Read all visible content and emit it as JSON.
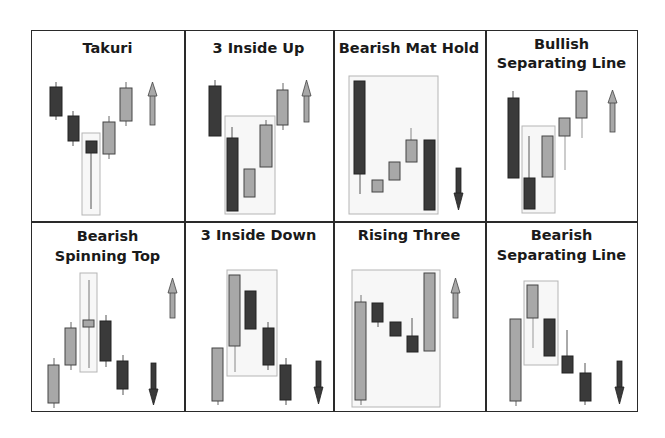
{
  "colors": {
    "bearish": "#3a3a3a",
    "bullish": "#a8a8a8",
    "border": "#2a2a2a",
    "highlight_box": "#b5b5b5",
    "highlight_fill": "#f7f7f7"
  },
  "panels": [
    {
      "title_lines": [
        "Takuri"
      ],
      "signal": "up"
    },
    {
      "title_lines": [
        "3 Inside Up"
      ],
      "signal": "up"
    },
    {
      "title_lines": [
        "Bearish Mat Hold"
      ],
      "signal": "down"
    },
    {
      "title_lines": [
        "Bullish",
        "Separating Line"
      ],
      "signal": "up"
    },
    {
      "title_lines": [
        "Bearish",
        "Spinning Top"
      ],
      "signal": "down"
    },
    {
      "title_lines": [
        "3 Inside Down"
      ],
      "signal": "down"
    },
    {
      "title_lines": [
        "Rising Three"
      ],
      "signal": "up"
    },
    {
      "title_lines": [
        "Bearish",
        "Separating Line"
      ],
      "signal": "down"
    }
  ]
}
